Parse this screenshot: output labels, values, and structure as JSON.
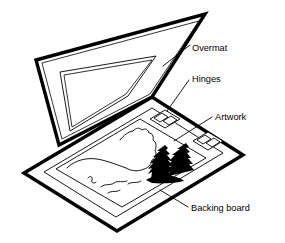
{
  "figure": {
    "type": "line-diagram",
    "background_color": "#ffffff",
    "line_color": "#000000"
  },
  "labels": {
    "overmat": "Overmat",
    "hinges": "Hinges",
    "artwork": "Artwork",
    "backing_board": "Backing board"
  },
  "parts": {
    "overmat_panel": "overmat-panel",
    "overmat_window": "overmat-window",
    "backing_board_panel": "backing-board-panel",
    "artwork_sheet": "artwork-sheet",
    "hinge_upper": "hinge-tab-upper",
    "hinge_lower": "hinge-tab-lower",
    "mountain_outline": "mountain-outline",
    "conifer_trees": "conifer-trees",
    "water_lines": "water-lines"
  },
  "leader_lines": {
    "overmat": "leader-overmat",
    "hinges": "leader-hinges",
    "artwork": "leader-artwork",
    "backing_board": "leader-backing-board"
  }
}
